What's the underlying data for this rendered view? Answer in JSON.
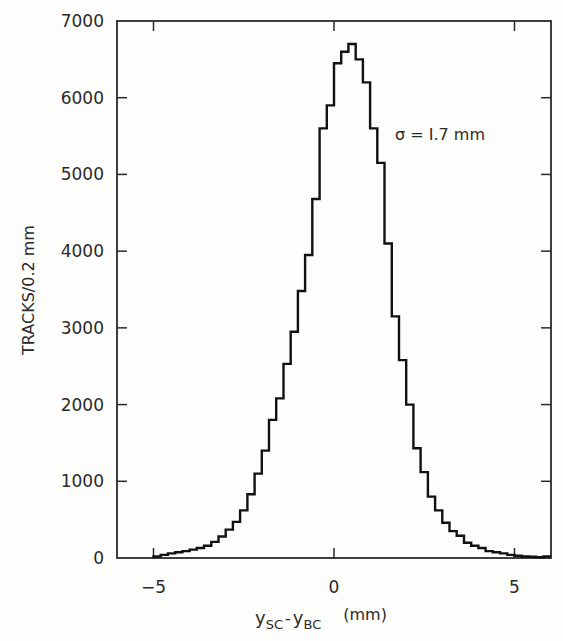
{
  "chart_data": {
    "type": "bar",
    "style": "step-histogram",
    "title": "",
    "xlabel": "y_SC - y_BC (mm)",
    "xlabel_parts": {
      "y1": "y",
      "sub1": "SC",
      "dash": "-",
      "y2": "y",
      "sub2": "BC",
      "unit": "(mm)"
    },
    "ylabel": "TRACKS/0.2 mm",
    "xlim": [
      -6,
      6
    ],
    "ylim": [
      0,
      7000
    ],
    "grid": false,
    "legend": null,
    "x_ticks": [
      -5,
      0,
      5
    ],
    "x_tick_labels": [
      "-5",
      "0",
      "5"
    ],
    "y_ticks": [
      0,
      1000,
      2000,
      3000,
      4000,
      5000,
      6000,
      7000
    ],
    "y_tick_labels": [
      "0",
      "1000",
      "2000",
      "3000",
      "4000",
      "5000",
      "6000",
      "7000"
    ],
    "annotations": [
      {
        "text": "σ = 1.7 mm",
        "x": 2.6,
        "y": 5250
      }
    ],
    "bin_width": 0.2,
    "bin_edges_start": -5.0,
    "bin_edges_end": 6.0,
    "values": [
      20,
      40,
      60,
      75,
      90,
      110,
      130,
      160,
      210,
      280,
      370,
      470,
      620,
      830,
      1100,
      1400,
      1800,
      2080,
      2530,
      2950,
      3480,
      3950,
      4680,
      5600,
      5900,
      6450,
      6600,
      6700,
      6500,
      6200,
      5600,
      5150,
      4100,
      3150,
      2580,
      2000,
      1430,
      1120,
      800,
      620,
      460,
      350,
      290,
      200,
      160,
      130,
      90,
      75,
      60,
      40,
      30,
      20,
      15,
      10,
      20
    ]
  },
  "annotation": {
    "sigma": "σ = I.7 mm"
  }
}
